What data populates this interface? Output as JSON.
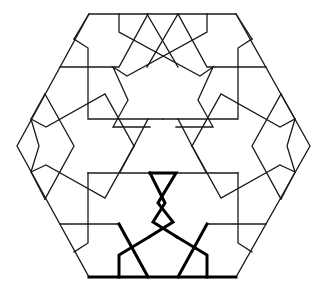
{
  "diagram": {
    "type": "geometric-pattern",
    "colors": {
      "background": "#ffffff",
      "line": "#1a1a1a",
      "highlight": "#000000"
    },
    "hexagon": [
      [
        89,
        14
      ],
      [
        236,
        14
      ],
      [
        310,
        146
      ],
      [
        236,
        277
      ],
      [
        89,
        277
      ],
      [
        17,
        146
      ]
    ],
    "thin_polylines": [
      [
        [
          119,
          14
        ],
        [
          119,
          32
        ],
        [
          200,
          76
        ],
        [
          213,
          67
        ],
        [
          198,
          100
        ],
        [
          213,
          127
        ],
        [
          176,
          127
        ]
      ],
      [
        [
          207,
          14
        ],
        [
          207,
          32
        ],
        [
          127,
          76
        ],
        [
          113,
          67
        ],
        [
          128,
          100
        ],
        [
          113,
          127
        ],
        [
          150,
          127
        ]
      ],
      [
        [
          147,
          14
        ],
        [
          178,
          67
        ]
      ],
      [
        [
          178,
          14
        ],
        [
          147,
          67
        ]
      ],
      [
        [
          89,
          14
        ],
        [
          74,
          39
        ]
      ],
      [
        [
          236,
          14
        ],
        [
          252,
          39
        ]
      ],
      [
        [
          74,
          39
        ],
        [
          88,
          48
        ],
        [
          88,
          119
        ],
        [
          163,
          119
        ]
      ],
      [
        [
          252,
          39
        ],
        [
          238,
          48
        ],
        [
          238,
          119
        ],
        [
          163,
          119
        ]
      ],
      [
        [
          60,
          67
        ],
        [
          119,
          67
        ],
        [
          148,
          14
        ]
      ],
      [
        [
          266,
          67
        ],
        [
          207,
          67
        ],
        [
          178,
          14
        ]
      ],
      [
        [
          45,
          94
        ],
        [
          31,
          119
        ],
        [
          39,
          146
        ],
        [
          31,
          172
        ],
        [
          45,
          199
        ]
      ],
      [
        [
          281,
          94
        ],
        [
          295,
          119
        ],
        [
          287,
          146
        ],
        [
          295,
          172
        ],
        [
          281,
          199
        ]
      ],
      [
        [
          45,
          94
        ],
        [
          74,
          146
        ],
        [
          45,
          199
        ]
      ],
      [
        [
          281,
          94
        ],
        [
          252,
          146
        ],
        [
          281,
          199
        ]
      ],
      [
        [
          31,
          119
        ],
        [
          46,
          127
        ],
        [
          105,
          94
        ],
        [
          134,
          146
        ]
      ],
      [
        [
          295,
          119
        ],
        [
          280,
          127
        ],
        [
          221,
          94
        ],
        [
          192,
          146
        ]
      ],
      [
        [
          31,
          172
        ],
        [
          46,
          165
        ],
        [
          105,
          198
        ],
        [
          134,
          146
        ]
      ],
      [
        [
          295,
          172
        ],
        [
          280,
          165
        ],
        [
          221,
          198
        ],
        [
          192,
          146
        ]
      ],
      [
        [
          134,
          146
        ],
        [
          148,
          119
        ]
      ],
      [
        [
          192,
          146
        ],
        [
          178,
          119
        ]
      ],
      [
        [
          134,
          146
        ],
        [
          120,
          172
        ]
      ],
      [
        [
          192,
          146
        ],
        [
          206,
          172
        ]
      ],
      [
        [
          88,
          173
        ],
        [
          88,
          243
        ],
        [
          74,
          252
        ]
      ],
      [
        [
          238,
          173
        ],
        [
          238,
          243
        ],
        [
          252,
          252
        ]
      ],
      [
        [
          88,
          173
        ],
        [
          150,
          173
        ]
      ],
      [
        [
          238,
          173
        ],
        [
          176,
          173
        ]
      ],
      [
        [
          60,
          224
        ],
        [
          119,
          224
        ]
      ],
      [
        [
          266,
          224
        ],
        [
          207,
          224
        ]
      ]
    ],
    "thick_polylines": [
      [
        [
          89,
          277
        ],
        [
          236,
          277
        ]
      ],
      [
        [
          150,
          173
        ],
        [
          176,
          173
        ],
        [
          158,
          203
        ],
        [
          173,
          222
        ],
        [
          149,
          237
        ]
      ],
      [
        [
          150,
          173
        ],
        [
          165,
          203
        ],
        [
          153,
          222
        ],
        [
          177,
          237
        ]
      ],
      [
        [
          119,
          224
        ],
        [
          148,
          277
        ]
      ],
      [
        [
          207,
          224
        ],
        [
          178,
          277
        ]
      ],
      [
        [
          177,
          237
        ],
        [
          207,
          255
        ],
        [
          207,
          277
        ]
      ],
      [
        [
          149,
          237
        ],
        [
          119,
          255
        ],
        [
          119,
          277
        ]
      ]
    ]
  }
}
